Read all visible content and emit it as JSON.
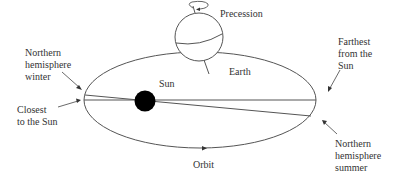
{
  "labels": {
    "precession": "Precession",
    "earth": "Earth",
    "sun": "Sun",
    "farthest": "Farthest\nfrom the\nSun",
    "closest": "Closest\nto the Sun",
    "nh_winter": "Northern\nhemisphere\nwinter",
    "nh_summer": "Northern\nhemisphere\nsummer",
    "orbit": "Orbit"
  },
  "icons": {
    "precession_arrow": "circular-arrow",
    "sun": "filled-circle",
    "earth": "globe"
  },
  "colors": {
    "line": "#444444",
    "sun": "#000000",
    "background": "#ffffff"
  }
}
